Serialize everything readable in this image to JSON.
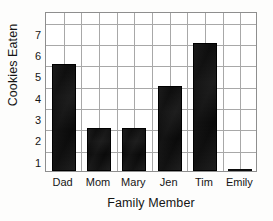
{
  "chart_data": {
    "type": "bar",
    "title": "",
    "subtitle": "",
    "xlabel": "Family Member",
    "ylabel": "Cookies Eaten",
    "categories": [
      "Dad",
      "Mom",
      "Mary",
      "Jen",
      "Tim",
      "Emily"
    ],
    "values": [
      5,
      2,
      2,
      4,
      6,
      0
    ],
    "ylim": [
      0,
      7.5
    ],
    "y_ticks": [
      1,
      2,
      3,
      4,
      5,
      6,
      7
    ],
    "y_tick_labels": [
      "1",
      "2",
      "3",
      "4",
      "5",
      "6",
      "7"
    ],
    "grid": true,
    "grid_horizontal": true,
    "grid_vertical": true,
    "vertical_gridlines_per_category": 2,
    "legend": false,
    "legend_position": "none",
    "bar_color": "#101010",
    "grid_color": "#a8a8a8",
    "axis_color": "#8e8e8e",
    "background_color": "#ffffff",
    "text_color": "#151515"
  }
}
